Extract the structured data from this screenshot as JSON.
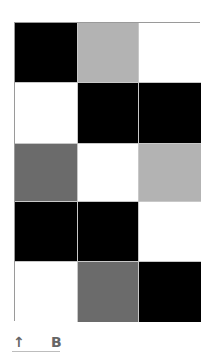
{
  "grid": {
    "rows": 5,
    "columns": 3,
    "colors": {
      "black": "#000000",
      "light_gray": "#b3b3b3",
      "dark_gray": "#6b6b6b",
      "white": "#ffffff"
    },
    "cells": [
      [
        "black",
        "light_gray",
        "white"
      ],
      [
        "white",
        "black",
        "black"
      ],
      [
        "dark_gray",
        "white",
        "light_gray"
      ],
      [
        "black",
        "black",
        "white"
      ],
      [
        "white",
        "dark_gray",
        "black"
      ]
    ]
  },
  "footer": {
    "arrow_icon": "↑",
    "label": "B"
  }
}
